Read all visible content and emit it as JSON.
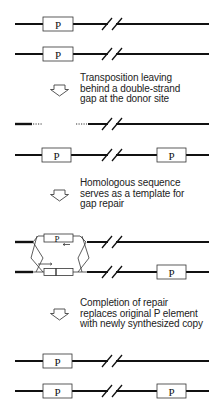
{
  "diagram": {
    "element_label": "P",
    "colors": {
      "dna": "#111111",
      "thin": "#333333",
      "box_fill": "#ffffff",
      "box_stroke": "#333333"
    },
    "steps": [
      {
        "lines": [
          "Transposition leaving",
          "behind a double-strand",
          "gap at the donor site"
        ]
      },
      {
        "lines": [
          "Homologous sequence",
          "serves as a template for",
          "gap repair"
        ]
      },
      {
        "lines": [
          "Completion of repair",
          "replaces original P element",
          "with newly synthesized copy"
        ]
      }
    ],
    "arrow_icon": "hollow-down-arrow"
  }
}
